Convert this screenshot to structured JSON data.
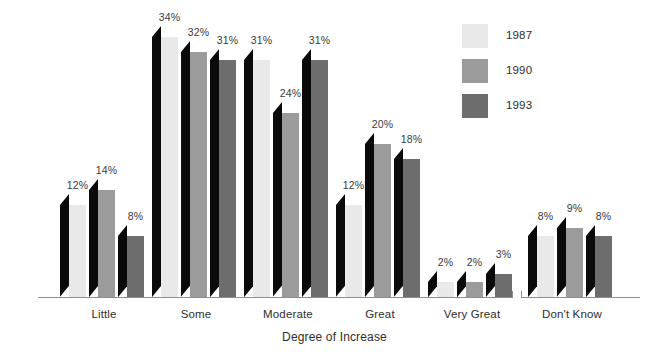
{
  "chart_data": {
    "type": "bar",
    "title": "",
    "subtitle": "",
    "xlabel": "Degree of Increase",
    "ylabel": "",
    "ylim": [
      0,
      36
    ],
    "grid": false,
    "legend_position": "top-right",
    "value_suffix": "%",
    "categories": [
      "Little",
      "Some",
      "Moderate",
      "Great",
      "Very Great",
      "Don't Know"
    ],
    "series": [
      {
        "name": "1987",
        "color": "#e9e9e9",
        "values": [
          12,
          34,
          31,
          12,
          2,
          8
        ],
        "labels": [
          "12%",
          "34%",
          "31%",
          "12%",
          "2%",
          "8%"
        ]
      },
      {
        "name": "1990",
        "color": "#9b9b9b",
        "values": [
          14,
          32,
          24,
          20,
          2,
          9
        ],
        "labels": [
          "14%",
          "32%",
          "24%",
          "20%",
          "2%",
          "9%"
        ]
      },
      {
        "name": "1993",
        "color": "#6d6d6d",
        "values": [
          8,
          31,
          31,
          18,
          3,
          8
        ],
        "labels": [
          "8%",
          "31%",
          "31%",
          "18%",
          "3%",
          "8%"
        ]
      }
    ],
    "axis_break": {
      "present": true,
      "between": [
        "Very Great",
        "Don't Know"
      ]
    },
    "side_face_color": "#0a0a0a",
    "axis_color": "#8d8d8d"
  },
  "legend": {
    "items": [
      {
        "label": "1987",
        "color": "#e9e9e9"
      },
      {
        "label": "1990",
        "color": "#9b9b9b"
      },
      {
        "label": "1993",
        "color": "#6d6d6d"
      }
    ]
  },
  "axis": {
    "title": "Degree of Increase"
  }
}
